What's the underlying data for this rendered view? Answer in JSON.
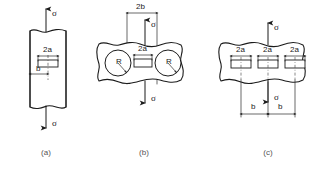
{
  "figure": {
    "background_color": "#ffffff",
    "line_color": "#1b1b1b",
    "caption_color": "#555555"
  },
  "symbols": {
    "sigma": "σ",
    "crack_length": "2a",
    "width": "2b",
    "spacing": "b",
    "radius": "R"
  },
  "panels": [
    {
      "id": "a",
      "caption": "(a)",
      "description": "Edge-offset central crack in a strip under uniaxial tension",
      "loads": [
        {
          "name": "top-stress",
          "label": "σ",
          "direction": "up"
        },
        {
          "name": "bottom-stress",
          "label": "σ",
          "direction": "down"
        }
      ],
      "dimensions": [
        {
          "name": "crack-length",
          "label": "2a"
        },
        {
          "name": "edge-distance",
          "label": "b"
        }
      ],
      "cracks": 1,
      "holes": 0
    },
    {
      "id": "b",
      "caption": "(b)",
      "description": "Central crack between two circular holes in a wide strip",
      "loads": [
        {
          "name": "top-stress",
          "label": "σ",
          "direction": "up"
        },
        {
          "name": "bottom-stress",
          "label": "σ",
          "direction": "down"
        }
      ],
      "dimensions": [
        {
          "name": "strip-width",
          "label": "2b"
        },
        {
          "name": "crack-length",
          "label": "2a"
        },
        {
          "name": "hole-radius-left",
          "label": "R"
        },
        {
          "name": "hole-radius-right",
          "label": "R"
        }
      ],
      "cracks": 1,
      "holes": 2
    },
    {
      "id": "c",
      "caption": "(c)",
      "description": "Three collinear periodic cracks in a strip under tension",
      "loads": [
        {
          "name": "top-stress",
          "label": "σ",
          "direction": "up"
        },
        {
          "name": "bottom-stress",
          "label": "σ",
          "direction": "down"
        }
      ],
      "dimensions": [
        {
          "name": "crack-length-left",
          "label": "2a"
        },
        {
          "name": "crack-length-center",
          "label": "2a"
        },
        {
          "name": "crack-length-right",
          "label": "2a"
        },
        {
          "name": "spacing-left",
          "label": "b"
        },
        {
          "name": "spacing-right",
          "label": "b"
        }
      ],
      "cracks": 3,
      "holes": 0
    }
  ]
}
